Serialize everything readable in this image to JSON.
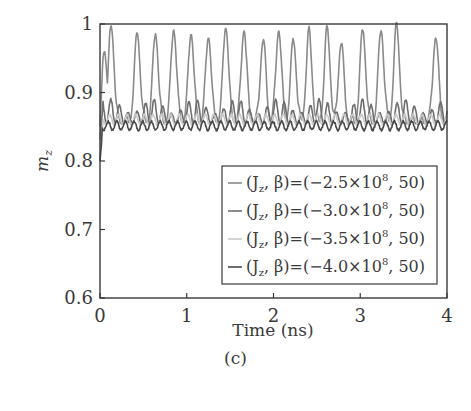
{
  "chart_data": {
    "type": "line",
    "title": "",
    "caption": "(c)",
    "xlabel": "Time (ns)",
    "ylabel": "m_z",
    "xlim": [
      0,
      4
    ],
    "ylim": [
      0.6,
      1.0
    ],
    "xticks": [
      0,
      1,
      2,
      3,
      4
    ],
    "yticks": [
      0.6,
      0.7,
      0.8,
      0.9,
      1
    ],
    "xtick_labels": [
      "0",
      "1",
      "2",
      "3",
      "4"
    ],
    "ytick_labels": [
      "0.6",
      "0.7",
      "0.8",
      "0.9",
      "1"
    ],
    "grid": false,
    "legend_position": "lower right",
    "series": [
      {
        "name": "(J_z, β)=(−2.5×10^8, 50)",
        "label_main": "(J",
        "label_sub": "z",
        "label_rest": ", β)=(−2.5×10",
        "label_sup": "8",
        "label_end": ", 50)",
        "color": "#8a8a8a",
        "stroke_width": 1.6,
        "baseline": 0.855,
        "peak_times": [
          0.05,
          0.13,
          0.43,
          0.64,
          0.85,
          1.05,
          1.25,
          1.45,
          1.66,
          1.88,
          2.06,
          2.23,
          2.41,
          2.62,
          2.78,
          3.03,
          3.24,
          3.42,
          3.87
        ],
        "peak_values": [
          0.96,
          0.995,
          0.985,
          0.985,
          0.99,
          0.985,
          0.98,
          0.995,
          0.99,
          0.975,
          0.99,
          0.975,
          0.985,
          0.99,
          0.97,
          0.99,
          0.99,
          0.995,
          0.98
        ],
        "description": "Large regular oscillations between ~0.855 and ~0.99 with period ~0.2 ns; irregular dip region near 2.8–3.0 ns"
      },
      {
        "name": "(J_z, β)=(−3.0×10^8, 50)",
        "label_main": "(J",
        "label_sub": "z",
        "label_rest": ", β)=(−3.0×10",
        "label_sup": "8",
        "label_end": ", 50)",
        "color": "#6e6e6e",
        "stroke_width": 1.6,
        "baseline": 0.855,
        "amplitude_max": 0.89,
        "description": "Small oscillations between ~0.855 and ~0.89, initial spike to ~0.895 at t≈0.02 ns"
      },
      {
        "name": "(J_z, β)=(−3.5×10^8, 50)",
        "label_main": "(J",
        "label_sub": "z",
        "label_rest": ", β)=(−3.5×10",
        "label_sup": "8",
        "label_end": ", 50)",
        "color": "#c9c9c9",
        "stroke_width": 1.6,
        "baseline": 0.853,
        "amplitude_max": 0.868,
        "description": "Light gray; small oscillations between ~0.853 and ~0.868"
      },
      {
        "name": "(J_z, β)=(−4.0×10^8, 50)",
        "label_main": "(J",
        "label_sub": "z",
        "label_rest": ", β)=(−4.0×10",
        "label_sup": "8",
        "label_end": ", 50)",
        "color": "#4a4a4a",
        "stroke_width": 1.6,
        "baseline": 0.845,
        "amplitude_max": 0.858,
        "start_value": 0.8,
        "description": "Dark gray; drops to ~0.80 at t≈0.02 then oscillates between ~0.845 and ~0.858"
      }
    ]
  }
}
